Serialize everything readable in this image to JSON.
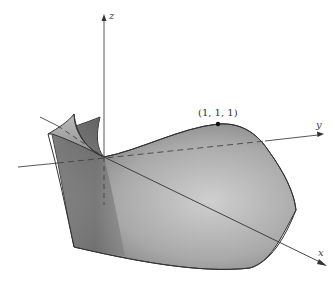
{
  "figure": {
    "type": "3d-surface-diagram",
    "axes": {
      "x": {
        "label": "x"
      },
      "y": {
        "label": "y"
      },
      "z": {
        "label": "z"
      }
    },
    "point": {
      "label": "(1, 1, 1)",
      "coords": [
        1,
        1,
        1
      ]
    },
    "colors": {
      "surface_light": "#c4c4c4",
      "surface_dark": "#6a6a6a",
      "edge": "#333333",
      "axis": "#444444"
    }
  }
}
